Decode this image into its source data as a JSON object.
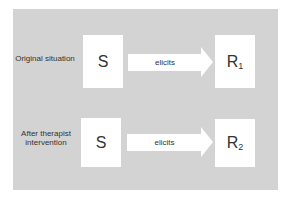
{
  "diagram": {
    "colors": {
      "panel": "#d3d3d3",
      "box": "#ffffff",
      "text": "#333333"
    },
    "rows": [
      {
        "label": "Original situation",
        "stimulus": "S",
        "relation": "elicits",
        "response": "R",
        "response_sub": "1"
      },
      {
        "label": "After therapist intervention",
        "stimulus": "S",
        "relation": "elicits",
        "response": "R",
        "response_sub": "2"
      }
    ]
  }
}
